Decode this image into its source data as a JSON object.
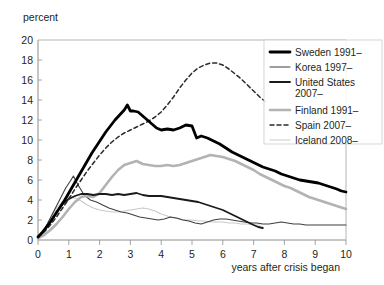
{
  "chart_data": {
    "type": "line",
    "title": "",
    "ylabel": "percent",
    "xlabel": "years after crisis began",
    "xlim": [
      0,
      10
    ],
    "ylim": [
      0,
      20
    ],
    "xticks": [
      "0",
      "1",
      "2",
      "3",
      "4",
      "5",
      "6",
      "7",
      "8",
      "9",
      "10"
    ],
    "yticks": [
      "0",
      "2",
      "4",
      "6",
      "8",
      "10",
      "12",
      "14",
      "16",
      "18",
      "20"
    ],
    "grid": false,
    "legend_position": "top-right",
    "series": [
      {
        "name": "Sweden 1991–",
        "color": "#000000",
        "width": 2.8,
        "dash": "none",
        "x": [
          0,
          0.12,
          0.25,
          0.4,
          0.55,
          0.7,
          0.85,
          1.0,
          1.15,
          1.3,
          1.45,
          1.6,
          1.75,
          1.9,
          2.05,
          2.2,
          2.35,
          2.5,
          2.65,
          2.8,
          2.9,
          3.0,
          3.1,
          3.25,
          3.4,
          3.55,
          3.7,
          3.85,
          4.0,
          4.2,
          4.4,
          4.6,
          4.8,
          5.0,
          5.15,
          5.3,
          5.5,
          5.7,
          5.9,
          6.1,
          6.3,
          6.5,
          6.7,
          6.9,
          7.1,
          7.3,
          7.5,
          7.7,
          7.9,
          8.1,
          8.3,
          8.5,
          8.7,
          8.9,
          9.1,
          9.3,
          9.5,
          9.7,
          9.85,
          10.0
        ],
        "y": [
          0.3,
          0.7,
          1.2,
          1.8,
          2.5,
          3.2,
          3.9,
          4.7,
          5.5,
          6.3,
          7.1,
          7.9,
          8.7,
          9.4,
          10.1,
          10.8,
          11.4,
          12.0,
          12.5,
          13.0,
          13.5,
          12.9,
          12.9,
          12.8,
          12.4,
          12.0,
          11.6,
          11.2,
          11.0,
          11.1,
          11.0,
          11.2,
          11.5,
          11.4,
          10.2,
          10.4,
          10.2,
          9.9,
          9.6,
          9.2,
          8.8,
          8.5,
          8.2,
          7.9,
          7.6,
          7.3,
          7.1,
          6.9,
          6.6,
          6.4,
          6.2,
          6.0,
          5.9,
          5.8,
          5.7,
          5.5,
          5.3,
          5.1,
          4.9,
          4.8
        ]
      },
      {
        "name": "Korea 1997–",
        "color": "#3f3f3f",
        "width": 1.1,
        "dash": "none",
        "x": [
          0,
          0.15,
          0.3,
          0.45,
          0.6,
          0.75,
          0.9,
          1.05,
          1.15,
          1.3,
          1.5,
          1.7,
          1.9,
          2.1,
          2.3,
          2.5,
          2.7,
          2.9,
          3.1,
          3.3,
          3.5,
          3.7,
          3.9,
          4.1,
          4.3,
          4.5,
          4.7,
          4.9,
          5.1,
          5.3,
          5.5,
          5.7,
          5.9,
          6.1,
          6.3,
          6.5,
          6.7,
          6.9,
          7.1,
          7.3,
          7.5,
          7.7,
          7.9,
          8.1,
          8.3,
          8.5,
          8.7,
          8.9,
          9.1,
          9.3,
          9.5,
          9.7,
          10.0
        ],
        "y": [
          0.3,
          0.8,
          1.6,
          2.5,
          3.4,
          4.3,
          5.2,
          5.9,
          6.4,
          5.5,
          4.5,
          4.0,
          3.8,
          3.5,
          3.2,
          3.0,
          2.8,
          2.7,
          2.5,
          2.3,
          2.2,
          2.1,
          2.0,
          2.1,
          2.3,
          2.2,
          2.0,
          1.9,
          1.7,
          1.6,
          1.8,
          2.0,
          2.1,
          2.1,
          2.0,
          1.9,
          1.8,
          1.7,
          1.7,
          1.6,
          1.6,
          1.7,
          1.8,
          1.7,
          1.6,
          1.6,
          1.5,
          1.5,
          1.5,
          1.5,
          1.5,
          1.5,
          1.5
        ]
      },
      {
        "name": "United States 2007–",
        "color": "#1a1a1a",
        "width": 1.8,
        "dash": "none",
        "x": [
          0,
          0.2,
          0.4,
          0.6,
          0.8,
          1.0,
          1.2,
          1.4,
          1.6,
          1.8,
          2.0,
          2.2,
          2.4,
          2.6,
          2.8,
          3.0,
          3.2,
          3.4,
          3.6,
          3.8,
          4.0,
          4.2,
          4.4,
          4.6,
          4.8,
          5.0,
          5.2,
          5.4,
          5.6,
          5.8,
          6.0,
          6.2,
          6.4,
          6.6,
          6.8,
          7.0,
          7.15,
          7.3
        ],
        "y": [
          0.3,
          0.9,
          1.8,
          2.8,
          3.6,
          4.1,
          4.4,
          4.6,
          4.6,
          4.5,
          4.6,
          4.6,
          4.5,
          4.6,
          4.5,
          4.6,
          4.7,
          4.5,
          4.4,
          4.4,
          4.4,
          4.3,
          4.2,
          4.1,
          4.0,
          3.9,
          3.8,
          3.6,
          3.4,
          3.2,
          3.0,
          2.7,
          2.4,
          2.1,
          1.8,
          1.5,
          1.3,
          1.2
        ]
      },
      {
        "name": "Finland 1991–",
        "color": "#b3b3b3",
        "width": 2.6,
        "dash": "none",
        "x": [
          0,
          0.2,
          0.4,
          0.6,
          0.8,
          1.0,
          1.2,
          1.4,
          1.6,
          1.8,
          2.0,
          2.2,
          2.4,
          2.6,
          2.8,
          3.0,
          3.2,
          3.4,
          3.6,
          3.8,
          4.0,
          4.2,
          4.4,
          4.6,
          4.8,
          5.0,
          5.2,
          5.4,
          5.6,
          5.8,
          6.0,
          6.2,
          6.4,
          6.6,
          6.8,
          7.0,
          7.2,
          7.4,
          7.6,
          7.8,
          8.0,
          8.2,
          8.4,
          8.6,
          8.8,
          9.0,
          9.2,
          9.4,
          9.6,
          9.8,
          10.0
        ],
        "y": [
          0.2,
          0.5,
          1.0,
          1.6,
          2.3,
          3.1,
          3.8,
          4.3,
          4.4,
          4.3,
          4.7,
          5.5,
          6.3,
          7.0,
          7.5,
          7.7,
          7.9,
          7.6,
          7.5,
          7.4,
          7.4,
          7.5,
          7.4,
          7.5,
          7.7,
          7.9,
          8.1,
          8.3,
          8.5,
          8.4,
          8.3,
          8.1,
          7.9,
          7.6,
          7.3,
          7.0,
          6.6,
          6.3,
          6.0,
          5.7,
          5.4,
          5.2,
          4.9,
          4.6,
          4.3,
          4.1,
          3.9,
          3.7,
          3.5,
          3.3,
          3.1
        ]
      },
      {
        "name": "Spain 2007–",
        "color": "#2b2b2b",
        "width": 1.5,
        "dash": "4,3",
        "x": [
          0,
          0.2,
          0.4,
          0.6,
          0.8,
          1.0,
          1.2,
          1.4,
          1.6,
          1.8,
          2.0,
          2.2,
          2.4,
          2.6,
          2.8,
          3.0,
          3.2,
          3.4,
          3.6,
          3.8,
          4.0,
          4.2,
          4.4,
          4.6,
          4.8,
          5.0,
          5.2,
          5.4,
          5.6,
          5.8,
          6.0,
          6.2,
          6.4,
          6.6,
          6.8,
          7.0,
          7.2,
          7.4
        ],
        "y": [
          0.3,
          0.8,
          1.5,
          2.3,
          3.2,
          4.1,
          5.1,
          6.0,
          6.9,
          7.7,
          8.5,
          9.2,
          9.8,
          10.3,
          10.7,
          11.0,
          11.3,
          11.6,
          11.9,
          12.3,
          12.8,
          13.5,
          14.3,
          15.2,
          16.0,
          16.7,
          17.2,
          17.5,
          17.7,
          17.7,
          17.5,
          17.1,
          16.6,
          16.1,
          15.5,
          14.9,
          14.3,
          13.8
        ]
      },
      {
        "name": "Iceland 2008–",
        "color": "#c9c9c9",
        "width": 1.1,
        "dash": "none",
        "x": [
          0,
          0.15,
          0.3,
          0.45,
          0.6,
          0.8,
          1.0,
          1.2,
          1.4,
          1.6,
          1.8,
          2.0,
          2.2,
          2.4,
          2.6,
          2.8,
          3.0,
          3.2,
          3.4,
          3.6,
          3.8,
          4.0,
          4.2,
          4.4,
          4.6,
          4.8,
          5.0,
          5.2,
          5.4,
          5.6,
          5.8,
          6.0,
          6.2,
          6.4,
          6.6,
          6.8,
          7.0,
          7.2
        ],
        "y": [
          0.2,
          0.7,
          1.5,
          2.4,
          3.2,
          3.9,
          4.3,
          4.2,
          3.9,
          3.5,
          3.2,
          3.0,
          2.9,
          2.8,
          2.8,
          2.9,
          3.0,
          3.1,
          3.2,
          3.1,
          2.9,
          2.6,
          2.4,
          2.2,
          2.1,
          2.0,
          2.0,
          1.9,
          1.9,
          1.8,
          1.8,
          1.8,
          1.7,
          1.7,
          1.6,
          1.6,
          1.5,
          1.5
        ]
      }
    ]
  }
}
